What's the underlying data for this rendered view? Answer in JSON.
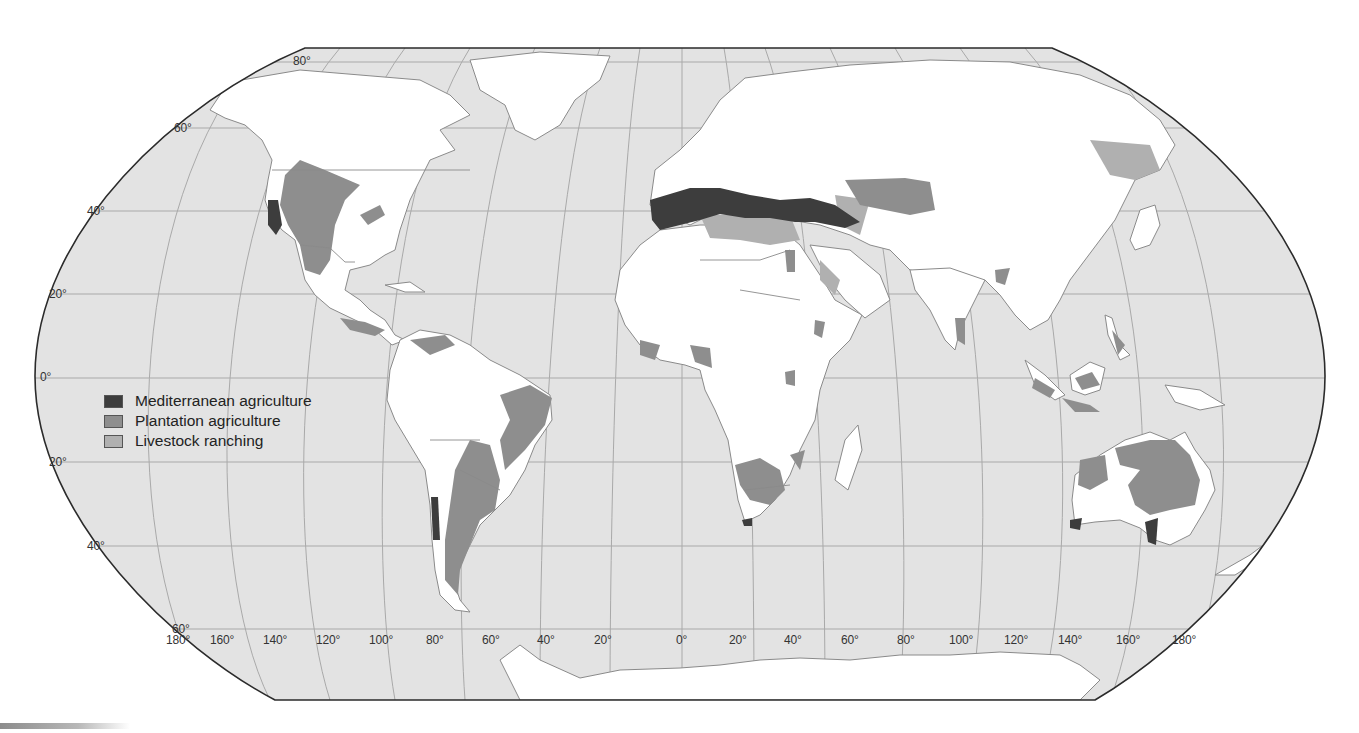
{
  "map": {
    "projection": "Robinson world map",
    "colors": {
      "ocean": "#e3e3e3",
      "land": "#ffffff",
      "mediterranean": "#3d3d3d",
      "plantation": "#8e8e8e",
      "livestock": "#b0b0b0",
      "frame": "#2b2b2b",
      "grid": "#a9a9a9"
    }
  },
  "legend": {
    "items": [
      {
        "label": "Mediterranean agriculture",
        "color": "#3d3d3d"
      },
      {
        "label": "Plantation agriculture",
        "color": "#8e8e8e"
      },
      {
        "label": "Livestock ranching",
        "color": "#b0b0b0"
      }
    ]
  },
  "latitude_labels": [
    "80°",
    "60°",
    "40°",
    "20°",
    "0°",
    "20°",
    "40°",
    "60°"
  ],
  "longitude_labels": [
    "180°",
    "160°",
    "140°",
    "120°",
    "100°",
    "80°",
    "60°",
    "40°",
    "20°",
    "0°",
    "20°",
    "40°",
    "60°",
    "80°",
    "100°",
    "120°",
    "140°",
    "160°",
    "180°"
  ]
}
